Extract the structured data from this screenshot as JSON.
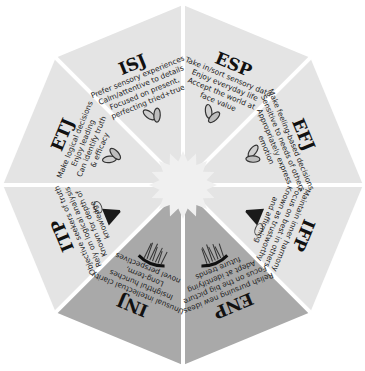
{
  "diagram": {
    "center": [
      183,
      185
    ],
    "colors": {
      "background": "#ffffff",
      "light_wedge": "#e4e4e4",
      "dark_wedge": "#a9a9a9",
      "divider": "#ffffff",
      "center_burst": "#f0f0f0",
      "text": "#111111"
    },
    "wedges": [
      {
        "id": "ISJ",
        "title": "ISJ",
        "lines": [
          "Prefer sensory experiences",
          "Calm/attentive to details",
          "Focused on present,",
          "perfecting tried+true"
        ],
        "icon": "seed-pair-icon",
        "shade": "light"
      },
      {
        "id": "ESP",
        "title": "ESP",
        "lines": [
          "Take in/sort sensory data",
          "Enjoy everyday life",
          "Accept the world at",
          "face value"
        ],
        "icon": "seed-pair-icon",
        "shade": "light"
      },
      {
        "id": "EFJ",
        "title": "EFJ",
        "lines": [
          "Make feeling-based decisions",
          "Sensitive to needs of others",
          "Appropriately express",
          "emotion"
        ],
        "icon": "seed-pair-icon",
        "shade": "light"
      },
      {
        "id": "IFP",
        "title": "IFP",
        "lines": [
          "Maintain inner harmony",
          "Focus on best in others",
          "Known as trustworthy",
          "and affirming"
        ],
        "icon": "funnel-icon",
        "shade": "light"
      },
      {
        "id": "ENP",
        "title": "ENP",
        "lines": [
          "Relish pursuing new ideas",
          "Focus on the big picture",
          "Adept at identifying",
          "future trends"
        ],
        "icon": "fringe-icon",
        "shade": "dark"
      },
      {
        "id": "INJ",
        "title": "INJ",
        "lines": [
          "Unusual intellectual clarity",
          "Insightful hunches",
          "Long-term,",
          "novel perspectives"
        ],
        "icon": "fringe-icon",
        "shade": "dark"
      },
      {
        "id": "ITP",
        "title": "ITP",
        "lines": [
          "Objective seekers of truth",
          "Rely on logical analysis",
          "Known for depth of",
          "knowledge"
        ],
        "icon": "funnel-icon",
        "shade": "light"
      },
      {
        "id": "ETJ",
        "title": "ETJ",
        "lines": [
          "Make logical decisions",
          "Enjoy leading",
          "Can identify truth",
          "& efficacy"
        ],
        "icon": "seed-pair-icon",
        "shade": "light"
      }
    ]
  }
}
